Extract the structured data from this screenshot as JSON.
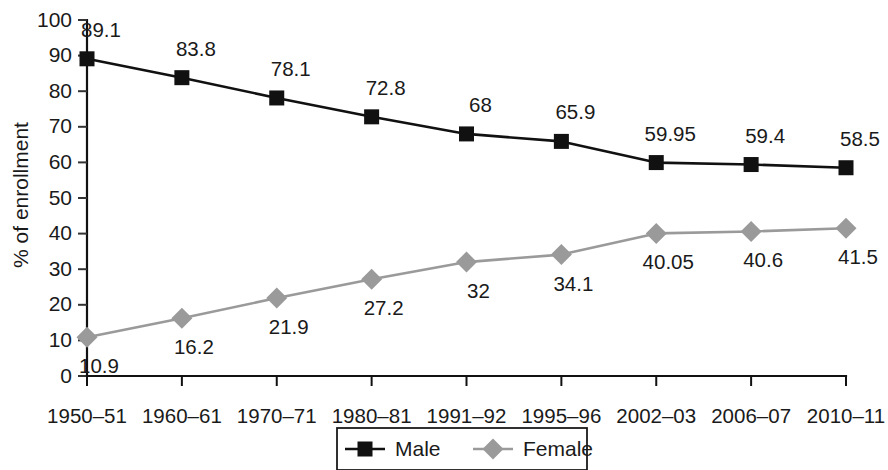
{
  "chart_data": {
    "type": "line",
    "title": "",
    "subtitle": "",
    "xlabel": "",
    "ylabel": "% of enrollment",
    "categories": [
      "1950–51",
      "1960–61",
      "1970–71",
      "1980–81",
      "1991–92",
      "1995–96",
      "2002–03",
      "2006–07",
      "2010–11"
    ],
    "series": [
      {
        "name": "Male",
        "values": [
          89.1,
          83.8,
          78.1,
          72.8,
          68,
          65.9,
          59.95,
          59.4,
          58.5
        ],
        "labels": [
          "89.1",
          "83.8",
          "78.1",
          "72.8",
          "68",
          "65.9",
          "59.95",
          "59.4",
          "58.5"
        ],
        "color": "#111111",
        "marker": "square",
        "label_position": "above"
      },
      {
        "name": "Female",
        "values": [
          10.9,
          16.2,
          21.9,
          27.2,
          32,
          34.1,
          40.05,
          40.6,
          41.5
        ],
        "labels": [
          "10.9",
          "16.2",
          "21.9",
          "27.2",
          "32",
          "34.1",
          "40.05",
          "40.6",
          "41.5"
        ],
        "color": "#9a9a9a",
        "marker": "diamond",
        "label_position": "below"
      }
    ],
    "ylim": [
      0,
      100
    ],
    "ytick_values": [
      0,
      10,
      20,
      30,
      40,
      50,
      60,
      70,
      80,
      90,
      100
    ],
    "ytick_labels": [
      "0",
      "10",
      "20",
      "30",
      "40",
      "50",
      "60",
      "70",
      "80",
      "90",
      "100"
    ],
    "grid": false,
    "legend_position": "bottom",
    "legend_entries": [
      {
        "label": "Male",
        "color": "#111111",
        "marker": "square"
      },
      {
        "label": "Female",
        "color": "#9a9a9a",
        "marker": "diamond"
      }
    ]
  }
}
